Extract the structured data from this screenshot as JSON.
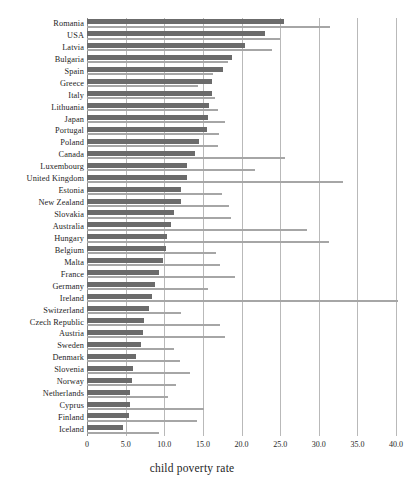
{
  "chart_data": {
    "type": "bar",
    "orientation": "horizontal",
    "title": "",
    "xlabel": "child poverty rate",
    "ylabel": "",
    "xlim": [
      0,
      40.0
    ],
    "xticks": [
      "0",
      "5.0",
      "10.0",
      "15.0",
      "20.0",
      "25.0",
      "30.0",
      "35.0",
      "40.0"
    ],
    "xtick_values": [
      0,
      5,
      10,
      15,
      20,
      25,
      30,
      35,
      40
    ],
    "grid": true,
    "legend": "none",
    "categories": [
      "Romania",
      "USA",
      "Latvia",
      "Bulgaria",
      "Spain",
      "Greece",
      "Italy",
      "Lithuania",
      "Japan",
      "Portugal",
      "Poland",
      "Canada",
      "Luxembourg",
      "United Kingdom",
      "Estonia",
      "New Zealand",
      "Slovakia",
      "Australia",
      "Hungary",
      "Belgium",
      "Malta",
      "France",
      "Germany",
      "Ireland",
      "Switzerland",
      "Czech Republic",
      "Austria",
      "Sweden",
      "Denmark",
      "Slovenia",
      "Norway",
      "Netherlands",
      "Cyprus",
      "Finland",
      "Iceland"
    ],
    "series": [
      {
        "name": "child poverty rate",
        "style": "thick-dark-bar",
        "color": "#6b6b6b",
        "values": [
          25.5,
          23.1,
          20.5,
          18.8,
          17.6,
          16.2,
          16.2,
          15.8,
          15.7,
          15.5,
          14.5,
          14.0,
          13.0,
          12.9,
          12.2,
          12.2,
          11.2,
          10.9,
          10.3,
          10.2,
          9.9,
          9.3,
          8.8,
          8.4,
          8.0,
          7.4,
          7.3,
          7.0,
          6.4,
          6.0,
          5.8,
          5.6,
          5.6,
          5.4,
          4.7
        ]
      },
      {
        "name": "secondary rate",
        "style": "thin-light-bar",
        "color": "#a6a6a6",
        "values": [
          31.4,
          25.0,
          24.0,
          18.2,
          16.3,
          14.4,
          16.6,
          17.0,
          17.8,
          17.1,
          17.0,
          25.6,
          21.7,
          33.2,
          17.5,
          18.4,
          18.6,
          28.5,
          31.3,
          16.7,
          17.2,
          19.1,
          15.6,
          40.2,
          12.2,
          17.2,
          17.8,
          11.2,
          12.0,
          13.3,
          11.5,
          10.5,
          15.1,
          14.2,
          9.3
        ]
      }
    ]
  }
}
